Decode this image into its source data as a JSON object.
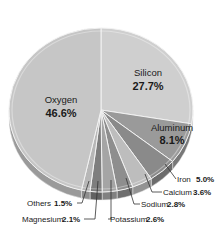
{
  "chart_data": {
    "type": "pie",
    "title": "",
    "style": "3d-pie",
    "categories": [
      "Oxygen",
      "Silicon",
      "Aluminum",
      "Iron",
      "Calcium",
      "Sodium",
      "Potassium",
      "Magnesium",
      "Others"
    ],
    "values": [
      46.6,
      27.7,
      8.1,
      5.0,
      3.6,
      2.8,
      2.6,
      2.1,
      1.5
    ],
    "unit": "%",
    "labels": [
      {
        "name": "Oxygen",
        "value": "46.6%"
      },
      {
        "name": "Silicon",
        "value": "27.7%"
      },
      {
        "name": "Aluminum",
        "value": "8.1%"
      },
      {
        "name": "Iron",
        "value": "5.0%"
      },
      {
        "name": "Calcium",
        "value": "3.6%"
      },
      {
        "name": "Sodium",
        "value": "2.8%"
      },
      {
        "name": "Potassium",
        "value": "2.6%"
      },
      {
        "name": "Magnesium",
        "value": "2.1%"
      },
      {
        "name": "Others",
        "value": "1.5%"
      }
    ],
    "slice_order_clockwise_from_top": [
      "Silicon",
      "Aluminum",
      "Iron",
      "Calcium",
      "Sodium",
      "Potassium",
      "Magnesium",
      "Others",
      "Oxygen"
    ],
    "colors": {
      "Silicon": "#cfcfcf",
      "Aluminum": "#9a9a9a",
      "Iron": "#8a8a8a",
      "Calcium": "#bdbdbd",
      "Sodium": "#8e8e8e",
      "Potassium": "#a5a5a5",
      "Magnesium": "#7e7e7e",
      "Others": "#b7b7b7",
      "Oxygen": "#c6c6c6"
    },
    "legend": "none (inline labels with leader lines)"
  }
}
